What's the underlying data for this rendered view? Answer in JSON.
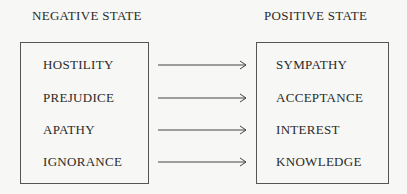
{
  "headers": {
    "left": "NEGATIVE STATE",
    "right": "POSITIVE STATE"
  },
  "rows": [
    {
      "negative": "HOSTILITY",
      "positive": "SYMPATHY"
    },
    {
      "negative": "PREJUDICE",
      "positive": "ACCEPTANCE"
    },
    {
      "negative": "APATHY",
      "positive": "INTEREST"
    },
    {
      "negative": "IGNORANCE",
      "positive": "KNOWLEDGE"
    }
  ]
}
